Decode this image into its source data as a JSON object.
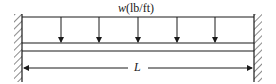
{
  "diagram": {
    "type": "fixed-fixed beam with uniformly distributed load",
    "load": {
      "symbol": "w",
      "units": "(lb/ft)",
      "arrow_count": 5
    },
    "span": {
      "label": "L"
    },
    "supports": [
      "fixed-left",
      "fixed-right"
    ],
    "colors": {
      "line": "#1a1a1a",
      "background": "#ffffff"
    }
  }
}
